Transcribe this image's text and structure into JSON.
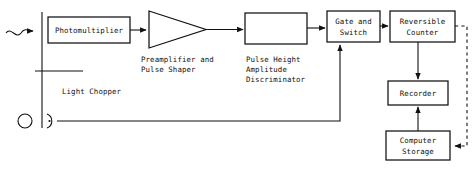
{
  "diagram": {
    "stroke_color": "#111111",
    "background_color": "#ffffff",
    "blocks": [
      {
        "id": "photomultiplier",
        "label": "Photomultiplier",
        "shape": "rect"
      },
      {
        "id": "preamplifier",
        "label": "",
        "shape": "triangle"
      },
      {
        "id": "discriminator",
        "label": "",
        "shape": "rect"
      },
      {
        "id": "gate_switch",
        "label_line1": "Gate and",
        "label_line2": "Switch",
        "shape": "rect"
      },
      {
        "id": "reversible_counter",
        "label_line1": "Reversible",
        "label_line2": "Counter",
        "shape": "rect"
      },
      {
        "id": "recorder",
        "label": "Recorder",
        "shape": "rect"
      },
      {
        "id": "computer_storage",
        "label_line1": "Computer",
        "label_line2": "Storage",
        "shape": "rect"
      }
    ],
    "captions": [
      {
        "id": "preamp_caption_line1",
        "text": "Preamplifier and"
      },
      {
        "id": "preamp_caption_line2",
        "text": "Pulse Shaper"
      },
      {
        "id": "discriminator_caption_line1",
        "text": "Pulse Height"
      },
      {
        "id": "discriminator_caption_line2",
        "text": "Amplitude"
      },
      {
        "id": "discriminator_caption_line3",
        "text": "Discriminator"
      },
      {
        "id": "chopper_caption",
        "text": "Light Chopper"
      }
    ],
    "symbols": [
      {
        "id": "incoming-light-wave",
        "name": "wavy-light-arrow"
      },
      {
        "id": "lamp",
        "name": "lamp-circle-icon"
      },
      {
        "id": "chopper-blade",
        "name": "chopper-blade-line"
      },
      {
        "id": "chopper-pickup",
        "name": "reference-detector-icon"
      }
    ]
  }
}
